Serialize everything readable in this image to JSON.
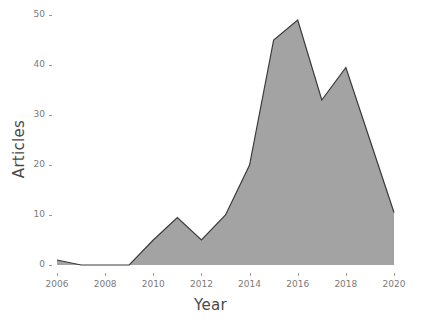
{
  "chart_data": {
    "type": "area",
    "title": "",
    "subtitle": "",
    "xlabel": "Year",
    "ylabel": "Articles",
    "x": [
      2006,
      2007,
      2008,
      2009,
      2010,
      2011,
      2012,
      2013,
      2014,
      2015,
      2016,
      2017,
      2018,
      2019,
      2020
    ],
    "values": [
      1,
      0,
      0,
      0,
      5,
      9.5,
      5,
      10,
      20,
      45,
      49,
      33,
      39.5,
      25,
      10.5
    ],
    "series": [
      {
        "name": "Articles",
        "values": [
          1,
          0,
          0,
          0,
          5,
          9.5,
          5,
          10,
          20,
          45,
          49,
          33,
          39.5,
          25,
          10.5
        ]
      }
    ],
    "xlim": [
      2006,
      2020
    ],
    "ylim": [
      0,
      50
    ],
    "xticks": [
      2006,
      2008,
      2010,
      2012,
      2014,
      2016,
      2018,
      2020
    ],
    "xtick_labels": [
      "2006",
      "2008",
      "2010",
      "2012",
      "2014",
      "2016",
      "2018",
      "2020"
    ],
    "yticks": [
      0,
      10,
      20,
      30,
      40,
      50
    ],
    "ytick_labels": [
      "0",
      "10",
      "20",
      "30",
      "40",
      "50"
    ],
    "grid": false,
    "legend": false,
    "legend_position": "none",
    "fill_color": "#a3a3a3",
    "line_color": "#3a3a3a",
    "background_color": "#ffffff",
    "axis_text_color": "#7a7a7a",
    "axis_title_color": "#4a4a4a"
  }
}
